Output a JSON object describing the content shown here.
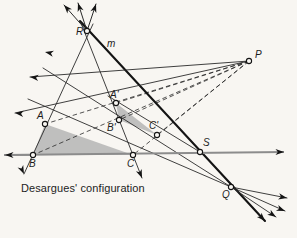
{
  "figure": {
    "caption": "Desargues' configuration",
    "line_label": "m",
    "colors": {
      "background": "#f8f6f2",
      "ink": "#2a2a2a",
      "bold_ink": "#141414",
      "triangle_fill": "#a9a9a9",
      "baseline": "#8c8c8c"
    }
  },
  "points": {
    "R": {
      "label": "R",
      "x": 87,
      "y": 31,
      "lx": 76,
      "ly": 27
    },
    "A": {
      "label": "A",
      "x": 45,
      "y": 124,
      "lx": 37,
      "ly": 111
    },
    "B": {
      "label": "B",
      "x": 33,
      "y": 155,
      "lx": 29,
      "ly": 159
    },
    "C": {
      "label": "C",
      "x": 133,
      "y": 155,
      "lx": 127,
      "ly": 159
    },
    "Ap": {
      "label": "A'",
      "x": 116,
      "y": 103,
      "lx": 110,
      "ly": 90
    },
    "Bp": {
      "label": "B'",
      "x": 119,
      "y": 120,
      "lx": 107,
      "ly": 123
    },
    "Cp": {
      "label": "C'",
      "x": 157,
      "y": 135,
      "lx": 149,
      "ly": 121
    },
    "P": {
      "label": "P",
      "x": 249,
      "y": 61,
      "lx": 255,
      "ly": 50
    },
    "Q": {
      "label": "Q",
      "x": 231,
      "y": 187,
      "lx": 222,
      "ly": 190
    },
    "S": {
      "label": "S",
      "x": 200,
      "y": 152,
      "lx": 203,
      "ly": 138
    }
  },
  "line_label_pos": {
    "x": 107,
    "y": 39
  },
  "geometry": {
    "triangles": [
      {
        "name": "triangle-ABC",
        "path": "M45,124 L33,155 L133,155 Z"
      },
      {
        "name": "triangle-ApBpCp",
        "path": "M116,103 L119,120 L157,135 Z"
      }
    ],
    "baseline": {
      "x1": 4,
      "y1": 155,
      "x2": 284,
      "y2": 152
    },
    "solid_lines": [
      {
        "name": "line-m-through-R-S-Q",
        "x1": 80,
        "y1": 21,
        "x2": 265,
        "y2": 221,
        "w": 2.1
      },
      {
        "name": "line-R-A-B",
        "x1": 93,
        "y1": 24,
        "x2": 24,
        "y2": 174,
        "w": 0.9
      },
      {
        "name": "line-R-Ap-Bp",
        "x1": 81,
        "y1": 23,
        "x2": 142,
        "y2": 178,
        "w": 0.9
      },
      {
        "name": "line-P-A-left-ray",
        "x1": 249,
        "y1": 61,
        "x2": 15,
        "y2": 113,
        "w": 0.9
      },
      {
        "name": "line-P-Ap-left-ray",
        "x1": 249,
        "y1": 61,
        "x2": 30,
        "y2": 77,
        "w": 0.9
      },
      {
        "name": "line-R-up-left-ray",
        "x1": 87,
        "y1": 31,
        "x2": 64,
        "y2": 5,
        "w": 1.0
      },
      {
        "name": "line-R-up-ray",
        "x1": 87,
        "y1": 31,
        "x2": 78,
        "y2": 3,
        "w": 1.0
      },
      {
        "name": "line-R-up-right-ray",
        "x1": 87,
        "y1": 31,
        "x2": 96,
        "y2": 4,
        "w": 1.0
      },
      {
        "name": "line-B-left-ray",
        "x1": 33,
        "y1": 155,
        "x2": 5,
        "y2": 155,
        "w": 0.9
      },
      {
        "name": "line-Q-A-ray",
        "x1": 231,
        "y1": 187,
        "x2": 43,
        "y2": 68,
        "w": 0.9
      },
      {
        "name": "line-Q-B-ray",
        "x1": 231,
        "y1": 187,
        "x2": 28,
        "y2": 99,
        "w": 0.9
      },
      {
        "name": "line-Q-right-ray-1",
        "x1": 231,
        "y1": 187,
        "x2": 287,
        "y2": 198,
        "w": 0.9
      },
      {
        "name": "line-Q-right-ray-2",
        "x1": 231,
        "y1": 187,
        "x2": 285,
        "y2": 211,
        "w": 0.9
      },
      {
        "name": "line-Q-right-ray-3",
        "x1": 231,
        "y1": 187,
        "x2": 276,
        "y2": 217,
        "w": 0.9
      },
      {
        "name": "line-S-Ap-Cp",
        "x1": 200,
        "y1": 152,
        "x2": 108,
        "y2": 96,
        "w": 0.9
      }
    ],
    "dashed_lines": [
      {
        "name": "dash-P-A",
        "x1": 249,
        "y1": 61,
        "x2": 45,
        "y2": 124
      },
      {
        "name": "dash-P-Ap",
        "x1": 249,
        "y1": 61,
        "x2": 116,
        "y2": 103
      },
      {
        "name": "dash-P-B",
        "x1": 249,
        "y1": 61,
        "x2": 33,
        "y2": 155
      },
      {
        "name": "dash-P-Bp",
        "x1": 249,
        "y1": 61,
        "x2": 119,
        "y2": 120
      },
      {
        "name": "dash-P-C",
        "x1": 249,
        "y1": 61,
        "x2": 133,
        "y2": 155
      },
      {
        "name": "dash-P-Cp",
        "x1": 249,
        "y1": 61,
        "x2": 157,
        "y2": 135
      }
    ],
    "arrow_heads": [
      {
        "name": "arrow-up-left-from-R",
        "x": 64,
        "y": 5,
        "angle": 228
      },
      {
        "name": "arrow-up-from-R",
        "x": 78,
        "y": 3,
        "angle": 252
      },
      {
        "name": "arrow-up-right-from-R",
        "x": 96,
        "y": 4,
        "angle": 288
      },
      {
        "name": "arrow-up-left-upper",
        "x": 45,
        "y": 52,
        "angle": 192
      },
      {
        "name": "arrow-up-left-lower",
        "x": 30,
        "y": 77,
        "angle": 186
      },
      {
        "name": "arrow-left-from-A",
        "x": 15,
        "y": 113,
        "angle": 186
      },
      {
        "name": "arrow-left-from-B",
        "x": 5,
        "y": 155,
        "angle": 180
      },
      {
        "name": "arrow-down-from-B",
        "x": 24,
        "y": 174,
        "angle": 65
      },
      {
        "name": "arrow-down-from-C",
        "x": 142,
        "y": 178,
        "angle": 68
      },
      {
        "name": "arrow-right-baseline",
        "x": 284,
        "y": 152,
        "angle": 0
      },
      {
        "name": "arrow-down-right-m",
        "x": 265,
        "y": 221,
        "angle": 47
      },
      {
        "name": "arrow-right-from-Q-1",
        "x": 287,
        "y": 198,
        "angle": 11
      },
      {
        "name": "arrow-right-from-Q-2",
        "x": 285,
        "y": 211,
        "angle": 22
      },
      {
        "name": "arrow-right-from-Q-3",
        "x": 276,
        "y": 217,
        "angle": 34
      }
    ]
  }
}
